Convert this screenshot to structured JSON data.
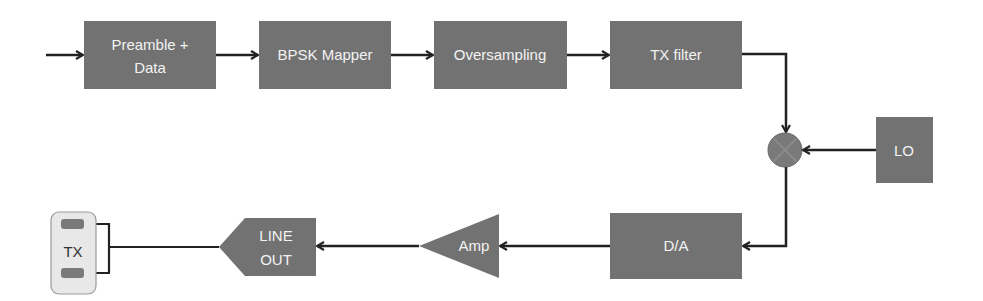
{
  "diagram": {
    "colors": {
      "block_fill": "#727272",
      "block_text": "#f2f2f2",
      "line": "#222222",
      "connector_fill": "#e8e8e8",
      "connector_border": "#9a9a9a",
      "pad_fill": "#7a7a7a"
    },
    "blocks": {
      "preamble": {
        "line1": "Preamble +",
        "line2": "Data"
      },
      "bpsk": {
        "label": "BPSK Mapper"
      },
      "oversampling": {
        "label": "Oversampling"
      },
      "txfilter": {
        "label": "TX filter"
      },
      "mixer": {
        "symbol": "multiply-icon"
      },
      "lo": {
        "label": "LO"
      },
      "da": {
        "label": "D/A"
      },
      "amp": {
        "label": "Amp"
      },
      "lineout": {
        "line1": "LINE",
        "line2": "OUT"
      },
      "tx": {
        "label": "TX"
      }
    },
    "connections": [
      "input -> Preamble + Data",
      "Preamble + Data -> BPSK Mapper",
      "BPSK Mapper -> Oversampling",
      "Oversampling -> TX filter",
      "TX filter -> Mixer",
      "LO -> Mixer",
      "Mixer -> D/A",
      "D/A -> Amp",
      "Amp -> LINE OUT",
      "LINE OUT -> TX"
    ]
  }
}
